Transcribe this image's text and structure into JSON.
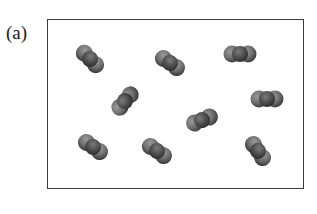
{
  "figure": {
    "label": "(a)",
    "box": {
      "x": 47,
      "y": 19,
      "width": 257,
      "height": 170
    },
    "atom_color": "#7a7a7a",
    "atom_edge_color": "#3e3e3e",
    "center_atom_color": "#5a5a5a",
    "atom_radius": 8.5,
    "bond_spacing": 8,
    "molecules": [
      {
        "cx": 90,
        "cy": 59,
        "angle": 45
      },
      {
        "cx": 170,
        "cy": 63,
        "angle": 35
      },
      {
        "cx": 240,
        "cy": 54,
        "angle": 0
      },
      {
        "cx": 125,
        "cy": 101,
        "angle": -50
      },
      {
        "cx": 267,
        "cy": 99,
        "angle": 0
      },
      {
        "cx": 202,
        "cy": 120,
        "angle": -22
      },
      {
        "cx": 93,
        "cy": 147,
        "angle": 35
      },
      {
        "cx": 157,
        "cy": 151,
        "angle": 35
      },
      {
        "cx": 258,
        "cy": 151,
        "angle": 55
      }
    ]
  }
}
